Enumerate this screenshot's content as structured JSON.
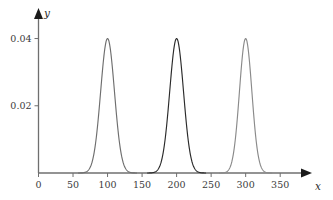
{
  "chart_data": {
    "type": "line",
    "title": "",
    "subtitle": "",
    "xlabel": "x",
    "ylabel": "y",
    "xlim": [
      0,
      370
    ],
    "ylim": [
      0,
      0.047
    ],
    "grid": false,
    "legend": null,
    "x_ticks": [
      0,
      50,
      100,
      150,
      200,
      250,
      300,
      350
    ],
    "x_tick_labels": [
      "0",
      "50",
      "100",
      "150",
      "200",
      "250",
      "300",
      "350"
    ],
    "y_ticks": [
      0.02,
      0.04
    ],
    "y_tick_labels": [
      "0.02",
      "0.04"
    ],
    "annotations": [],
    "series": [
      {
        "name": "peak-1",
        "shape": "gaussian",
        "center": 100,
        "amplitude": 0.04,
        "sigma": 10,
        "color": "#6e6e6e",
        "x": [
          60,
          70,
          75,
          80,
          85,
          90,
          95,
          100,
          105,
          110,
          115,
          120,
          125,
          130,
          140
        ],
        "y": [
          0.0,
          0.0001,
          0.0004,
          0.0022,
          0.0081,
          0.0197,
          0.0324,
          0.04,
          0.0324,
          0.0197,
          0.0081,
          0.0022,
          0.0004,
          0.0001,
          0.0
        ]
      },
      {
        "name": "peak-2",
        "shape": "gaussian",
        "center": 200,
        "amplitude": 0.04,
        "sigma": 10,
        "color": "#2a2a2a",
        "x": [
          160,
          170,
          175,
          180,
          185,
          190,
          195,
          200,
          205,
          210,
          215,
          220,
          225,
          230,
          240
        ],
        "y": [
          0.0,
          0.0001,
          0.0004,
          0.0022,
          0.0081,
          0.0197,
          0.0324,
          0.04,
          0.0324,
          0.0197,
          0.0081,
          0.0022,
          0.0004,
          0.0001,
          0.0
        ]
      },
      {
        "name": "peak-3",
        "shape": "gaussian",
        "center": 300,
        "amplitude": 0.04,
        "sigma": 9,
        "color": "#8a8a8a",
        "x": [
          262,
          272,
          277,
          281,
          286,
          291,
          295,
          300,
          305,
          309,
          314,
          319,
          323,
          328,
          338
        ],
        "y": [
          0.0,
          0.0001,
          0.0004,
          0.0022,
          0.0081,
          0.0197,
          0.0324,
          0.04,
          0.0324,
          0.0197,
          0.0081,
          0.0022,
          0.0004,
          0.0001,
          0.0
        ]
      }
    ],
    "colors": {
      "axis": "#6f6f6f",
      "axis_arrow": "#1a1a1a",
      "tick_text": "#3b3b3b",
      "background": "#ffffff"
    }
  }
}
